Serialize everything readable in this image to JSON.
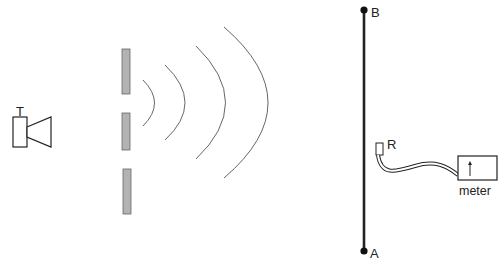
{
  "diagram": {
    "labels": {
      "transmitter": "T",
      "point_b": "B",
      "point_a": "A",
      "receiver": "R",
      "meter": "meter"
    },
    "colors": {
      "line": "#222222",
      "barrier_fill": "#b3b3b3",
      "barrier_stroke": "#666666",
      "wave": "#666666"
    },
    "barriers": 3,
    "wavefronts": 4
  }
}
